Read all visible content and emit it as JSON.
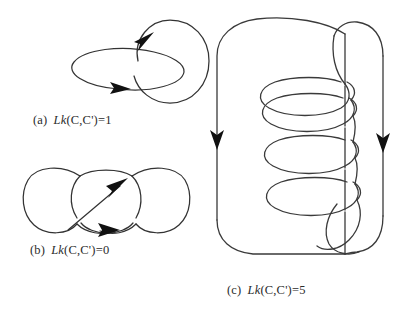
{
  "figure": {
    "background_color": "#ffffff",
    "stroke_color": "#333333",
    "arrow_color": "#111111",
    "panels": [
      {
        "id": "a",
        "label": "(a)",
        "lk_symbol": "Lk",
        "expression": "(C,C')=1",
        "caption_full": "(a)  Lk(C,C')=1",
        "linking_number": 1,
        "description": "Hopf link: a horizontal ellipse interlocked with a circle",
        "arrow_count": 2
      },
      {
        "id": "b",
        "label": "(b)",
        "lk_symbol": "Lk",
        "expression": "(C,C')=0",
        "caption_full": "(b)  Lk(C,C')=0",
        "linking_number": 0,
        "description": "Two unlinked loops crossing twice with opposite signs",
        "arrow_count": 2
      },
      {
        "id": "c",
        "label": "(c)",
        "lk_symbol": "Lk",
        "expression": "(C,C')=5",
        "caption_full": "(c)  Lk(C,C')=5",
        "linking_number": 5,
        "description": "A closed curve coiled five times around a long closed loop",
        "coil_turns": 5,
        "arrow_count": 2
      }
    ]
  }
}
